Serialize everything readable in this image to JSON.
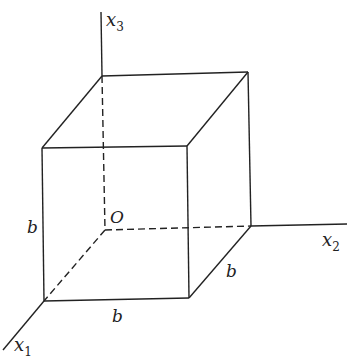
{
  "diagram": {
    "type": "cube-in-coordinate-axes",
    "axes": {
      "x1": {
        "base": "x",
        "sub": "1"
      },
      "x2": {
        "base": "x",
        "sub": "2"
      },
      "x3": {
        "base": "x",
        "sub": "3"
      }
    },
    "origin_label": "O",
    "edge_labels": {
      "vertical": "b",
      "front_bottom": "b",
      "depth": "b"
    },
    "colors": {
      "stroke": "#222222",
      "background": "#ffffff"
    }
  }
}
